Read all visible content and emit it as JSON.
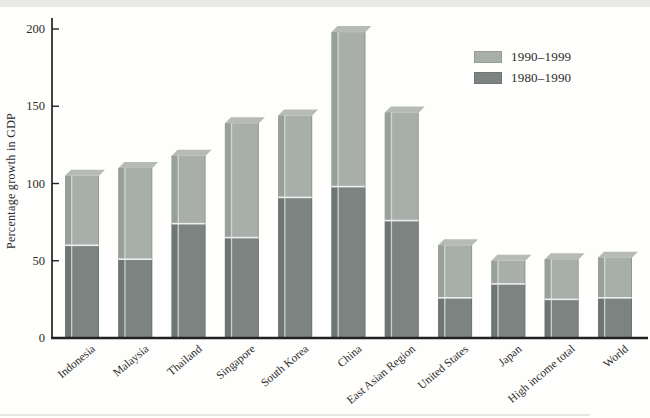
{
  "figure": {
    "kind": "scanned book figure",
    "background": "#fefefc",
    "scan_strip_color": "#e8e8e5"
  },
  "chart_data": {
    "type": "bar",
    "stacked": true,
    "title": "",
    "xlabel": "",
    "ylabel": "Percentage growth in GDP",
    "ylim": [
      0,
      200
    ],
    "yticks": [
      0,
      50,
      100,
      150,
      200
    ],
    "grid": false,
    "legend_position": "upper-right",
    "categories": [
      "Indonesia",
      "Malaysia",
      "Thailand",
      "Singapore",
      "South Korea",
      "China",
      "East Asian Region",
      "United States",
      "Japan",
      "High income total",
      "World"
    ],
    "series": [
      {
        "name": "1980–1990",
        "stack_order": "bottom",
        "values": [
          60,
          51,
          74,
          65,
          91,
          98,
          76,
          26,
          35,
          25,
          26
        ],
        "color_front": "#7c8482",
        "color_side": "#6e7573"
      },
      {
        "name": "1990–1999",
        "stack_order": "top",
        "values": [
          45,
          59,
          44,
          74,
          53,
          100,
          70,
          34,
          15,
          26,
          26
        ],
        "color_front": "#a8aeaa",
        "color_side": "#999f9b",
        "color_top": "#b6bbb6"
      }
    ],
    "totals": [
      105,
      110,
      118,
      139,
      144,
      198,
      146,
      60,
      50,
      51,
      52
    ]
  },
  "legend": {
    "items": [
      {
        "label": "1990–1999",
        "swatch": "#a8aeaa"
      },
      {
        "label": "1980–1990",
        "swatch": "#7c8482"
      }
    ]
  },
  "colors": {
    "axis": "#222222",
    "tick_text": "#2c2c2c",
    "segment_separator": "#edefec",
    "bar_highlight_line": "#d8dcd8",
    "bar_right_shade": "rgba(0,0,0,0.12)"
  }
}
